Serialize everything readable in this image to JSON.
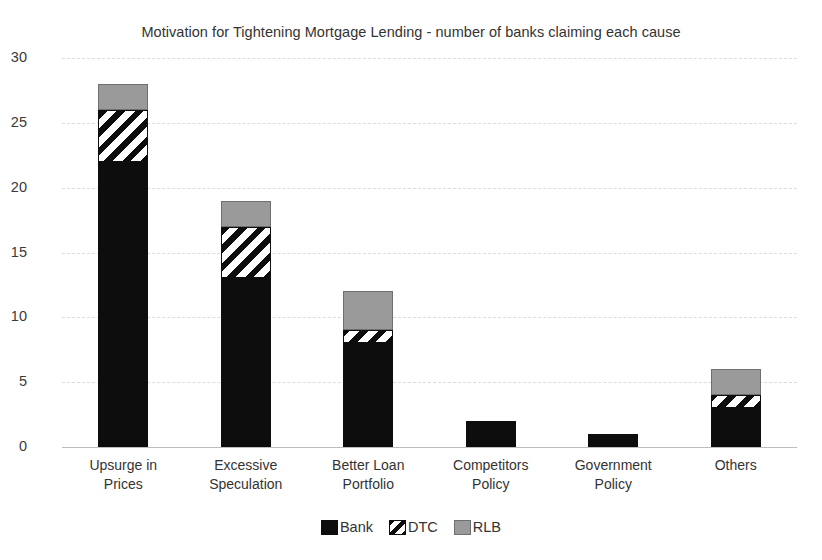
{
  "chart_data": {
    "type": "bar",
    "subtype": "stacked-bar",
    "title": "Motivation for Tightening Mortgage Lending - number of banks claiming each cause",
    "xlabel": "",
    "ylabel": "",
    "ylim": [
      0,
      30
    ],
    "ytick_step": 5,
    "yticks": [
      "30",
      "25",
      "20",
      "15",
      "10",
      "5",
      "0"
    ],
    "grid": true,
    "grid_axis": "y",
    "legend_position": "bottom",
    "categories": [
      "Upsurge in\nPrices",
      "Excessive\nSpeculation",
      "Better Loan\nPortfolio",
      "Competitors\nPolicy",
      "Government\nPolicy",
      "Others"
    ],
    "category_lines": [
      [
        "Upsurge in",
        "Prices"
      ],
      [
        "Excessive",
        "Speculation"
      ],
      [
        "Better Loan",
        "Portfolio"
      ],
      [
        "Competitors",
        "Policy"
      ],
      [
        "Government",
        "Policy"
      ],
      [
        "Others"
      ]
    ],
    "series": [
      {
        "name": "Bank",
        "fill": "solid-black",
        "color": "#0d0d0d",
        "values": [
          22,
          13,
          8,
          2,
          1,
          3
        ]
      },
      {
        "name": "DTC",
        "fill": "diagonal-hatch",
        "color": "#ffffff",
        "values": [
          4,
          4,
          1,
          0,
          0,
          1
        ]
      },
      {
        "name": "RLB",
        "fill": "solid-gray",
        "color": "#9a9a9a",
        "values": [
          2,
          2,
          3,
          0,
          0,
          2
        ]
      }
    ],
    "totals": [
      28,
      19,
      12,
      2,
      1,
      6
    ]
  },
  "legend": {
    "items": [
      {
        "label": "Bank",
        "swatch": "solid-black"
      },
      {
        "label": "DTC",
        "swatch": "diagonal-hatch"
      },
      {
        "label": "RLB",
        "swatch": "solid-gray"
      }
    ]
  },
  "colors": {
    "bank": "#0d0d0d",
    "dtc_line": "#0d0d0d",
    "dtc_fill": "#ffffff",
    "rlb": "#9a9a9a",
    "gridline": "#dcdcdc",
    "axis": "#bdbdbd",
    "text": "#333333"
  }
}
